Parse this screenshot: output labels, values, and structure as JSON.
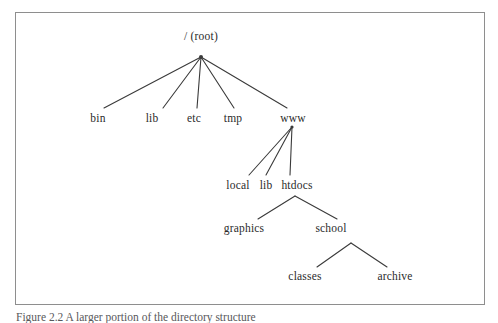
{
  "figure": {
    "caption": "Figure 2.2  A larger portion of the directory structure",
    "frame_color": "#8e8e8e",
    "line_color": "#3a3a3a",
    "text_color": "#2b2b2b",
    "background": "#ffffff"
  },
  "diagram": {
    "type": "tree",
    "nodes": [
      {
        "id": "root",
        "label": "/ (root)",
        "x": 201,
        "y": 36,
        "level": 0
      },
      {
        "id": "bin",
        "label": "bin",
        "x": 98,
        "y": 118,
        "level": 1
      },
      {
        "id": "lib",
        "label": "lib",
        "x": 152,
        "y": 118,
        "level": 1
      },
      {
        "id": "etc",
        "label": "etc",
        "x": 194,
        "y": 118,
        "level": 1
      },
      {
        "id": "tmp",
        "label": "tmp",
        "x": 233,
        "y": 118,
        "level": 1
      },
      {
        "id": "www",
        "label": "www",
        "x": 293,
        "y": 118,
        "level": 1
      },
      {
        "id": "local",
        "label": "local",
        "x": 238,
        "y": 185,
        "level": 2
      },
      {
        "id": "wwwlib",
        "label": "lib",
        "x": 266,
        "y": 185,
        "level": 2
      },
      {
        "id": "htdocs",
        "label": "htdocs",
        "x": 297,
        "y": 185,
        "level": 2
      },
      {
        "id": "graphics",
        "label": "graphics",
        "x": 244,
        "y": 228,
        "level": 3
      },
      {
        "id": "school",
        "label": "school",
        "x": 331,
        "y": 228,
        "level": 3
      },
      {
        "id": "classes",
        "label": "classes",
        "x": 305,
        "y": 276,
        "level": 4
      },
      {
        "id": "archive",
        "label": "archive",
        "x": 395,
        "y": 276,
        "level": 4
      }
    ],
    "edges": [
      {
        "from": "root",
        "to": "bin",
        "x1": 201,
        "y1": 57,
        "x2": 104,
        "y2": 108
      },
      {
        "from": "root",
        "to": "lib",
        "x1": 201,
        "y1": 57,
        "x2": 163,
        "y2": 108
      },
      {
        "from": "root",
        "to": "etc",
        "x1": 201,
        "y1": 57,
        "x2": 197,
        "y2": 108
      },
      {
        "from": "root",
        "to": "tmp",
        "x1": 201,
        "y1": 57,
        "x2": 234,
        "y2": 108
      },
      {
        "from": "root",
        "to": "www",
        "x1": 201,
        "y1": 57,
        "x2": 287,
        "y2": 108
      },
      {
        "from": "www",
        "to": "local",
        "x1": 292,
        "y1": 127,
        "x2": 249,
        "y2": 175
      },
      {
        "from": "www",
        "to": "wwwlib",
        "x1": 292,
        "y1": 127,
        "x2": 266,
        "y2": 175
      },
      {
        "from": "www",
        "to": "htdocs",
        "x1": 292,
        "y1": 127,
        "x2": 290,
        "y2": 175
      },
      {
        "from": "htdocs",
        "to": "graphics",
        "x1": 295,
        "y1": 196,
        "x2": 258,
        "y2": 219
      },
      {
        "from": "htdocs",
        "to": "school",
        "x1": 295,
        "y1": 196,
        "x2": 337,
        "y2": 219
      },
      {
        "from": "school",
        "to": "classes",
        "x1": 351,
        "y1": 243,
        "x2": 317,
        "y2": 267
      },
      {
        "from": "school",
        "to": "archive",
        "x1": 351,
        "y1": 243,
        "x2": 387,
        "y2": 267
      }
    ]
  }
}
